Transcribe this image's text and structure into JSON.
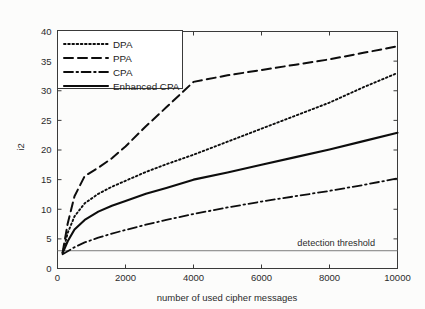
{
  "chart_data": {
    "type": "line",
    "title": "",
    "xlabel": "number of used cipher messages",
    "ylabel": "i2",
    "xlim": [
      0,
      10000
    ],
    "ylim": [
      0,
      40
    ],
    "xticks": [
      0,
      2000,
      4000,
      6000,
      8000,
      10000
    ],
    "yticks": [
      0,
      5,
      10,
      15,
      20,
      25,
      30,
      35,
      40
    ],
    "xtick_labels": [
      "0",
      "2000",
      "4000",
      "6000",
      "8000",
      "10000"
    ],
    "ytick_labels": [
      "0",
      "5",
      "10",
      "15",
      "20",
      "25",
      "30",
      "35",
      "40"
    ],
    "grid": false,
    "legend_position": "upper-left",
    "series": [
      {
        "name": "DPA",
        "style": "dotted",
        "x": [
          150,
          300,
          500,
          800,
          1200,
          1600,
          2000,
          2600,
          3200,
          4000,
          5000,
          6000,
          7000,
          8000,
          9000,
          10000
        ],
        "values": [
          2.6,
          6.0,
          8.8,
          11.0,
          12.6,
          13.8,
          14.8,
          16.3,
          17.6,
          19.2,
          21.4,
          23.6,
          25.8,
          28.0,
          30.6,
          33.0
        ]
      },
      {
        "name": "PPA",
        "style": "dashed",
        "x": [
          150,
          300,
          500,
          800,
          1200,
          1600,
          2000,
          2600,
          3200,
          4000,
          5000,
          6000,
          7000,
          8000,
          9000,
          10000
        ],
        "values": [
          2.7,
          7.6,
          12.2,
          15.6,
          17.0,
          18.6,
          20.6,
          24.0,
          27.2,
          31.5,
          32.6,
          33.5,
          34.4,
          35.3,
          36.4,
          37.5
        ]
      },
      {
        "name": "CPA",
        "style": "dash-dot",
        "x": [
          150,
          300,
          500,
          800,
          1200,
          1600,
          2000,
          2600,
          3200,
          4000,
          5000,
          6000,
          7000,
          8000,
          9000,
          10000
        ],
        "values": [
          2.4,
          2.9,
          3.6,
          4.4,
          5.2,
          5.9,
          6.5,
          7.4,
          8.2,
          9.2,
          10.3,
          11.3,
          12.2,
          13.1,
          14.1,
          15.2
        ]
      },
      {
        "name": "Enhanced CPA",
        "style": "solid",
        "x": [
          150,
          300,
          500,
          800,
          1200,
          1600,
          2000,
          2600,
          3200,
          4000,
          5000,
          6000,
          7000,
          8000,
          9000,
          10000
        ],
        "values": [
          2.6,
          4.6,
          6.6,
          8.2,
          9.6,
          10.6,
          11.4,
          12.6,
          13.6,
          15.0,
          16.2,
          17.5,
          18.8,
          20.1,
          21.5,
          22.9
        ]
      }
    ],
    "annotations": [
      {
        "name": "detection-threshold",
        "label": "detection threshold",
        "y_value": 3.0,
        "style": "horizontal-line"
      }
    ]
  },
  "legend": {
    "entries": [
      {
        "label": "DPA"
      },
      {
        "label": "PPA"
      },
      {
        "label": "CPA"
      },
      {
        "label": "Enhanced CPA"
      }
    ]
  },
  "colors": {
    "line": "#0d0d0d",
    "axis": "#3a3a3a",
    "threshold": "#7c7c7c",
    "background": "#ffffff"
  }
}
